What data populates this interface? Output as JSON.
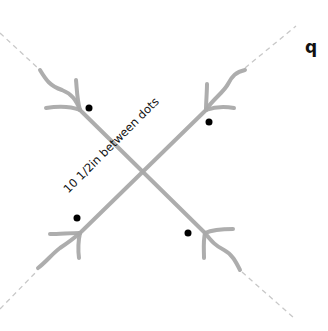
{
  "diagram": {
    "measurement_label": "10 1/2in between dots",
    "corner_letter": "q",
    "colors": {
      "stalk": "#a9a9a9",
      "dashed_guide": "#c8c8c8",
      "dot": "#000000",
      "text": "#111111"
    },
    "elements": {
      "stalks": [
        "stalk-a (top-left to bottom-right)",
        "stalk-b (top-right to bottom-left)"
      ],
      "dot_count": 4
    }
  }
}
